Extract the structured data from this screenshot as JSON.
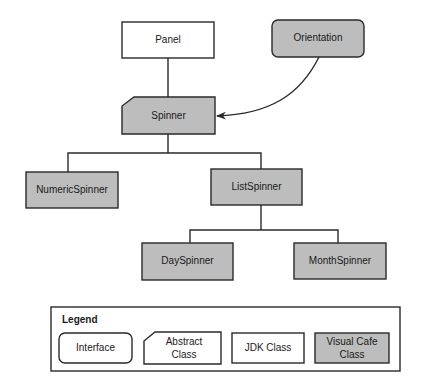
{
  "diagram": {
    "colors": {
      "visual_cafe_fill": "#bdbdbd",
      "jdk_fill": "#ffffff",
      "stroke": "#2a2a2a",
      "text": "#1a1a1a"
    },
    "nodes": [
      {
        "id": "panel",
        "label": "Panel",
        "kind": "jdk-class",
        "x": 122,
        "y": 22,
        "w": 92,
        "h": 36
      },
      {
        "id": "orientation",
        "label": "Orientation",
        "kind": "visual-cafe-interface",
        "x": 272,
        "y": 20,
        "w": 92,
        "h": 37
      },
      {
        "id": "spinner",
        "label": "Spinner",
        "kind": "visual-cafe-abstract-class",
        "x": 122,
        "y": 97,
        "w": 93,
        "h": 37
      },
      {
        "id": "numericspinner",
        "label": "NumericSpinner",
        "kind": "visual-cafe-class",
        "x": 26,
        "y": 172,
        "w": 92,
        "h": 36
      },
      {
        "id": "listspinner",
        "label": "ListSpinner",
        "kind": "visual-cafe-class",
        "x": 211,
        "y": 169,
        "w": 91,
        "h": 36
      },
      {
        "id": "dayspinner",
        "label": "DaySpinner",
        "kind": "visual-cafe-class",
        "x": 142,
        "y": 243,
        "w": 91,
        "h": 37
      },
      {
        "id": "monthspinner",
        "label": "MonthSpinner",
        "kind": "visual-cafe-class",
        "x": 294,
        "y": 243,
        "w": 92,
        "h": 36
      }
    ],
    "edges": [
      {
        "from": "panel",
        "to": "spinner",
        "type": "inheritance"
      },
      {
        "from": "orientation",
        "to": "spinner",
        "type": "implements-arrow"
      },
      {
        "from": "spinner",
        "to": "numericspinner",
        "type": "inheritance"
      },
      {
        "from": "spinner",
        "to": "listspinner",
        "type": "inheritance"
      },
      {
        "from": "listspinner",
        "to": "dayspinner",
        "type": "inheritance"
      },
      {
        "from": "listspinner",
        "to": "monthspinner",
        "type": "inheritance"
      }
    ]
  },
  "legend": {
    "title": "Legend",
    "items": [
      {
        "label_line1": "Interface",
        "label_line2": "",
        "kind": "interface"
      },
      {
        "label_line1": "Abstract",
        "label_line2": "Class",
        "kind": "abstract-class"
      },
      {
        "label_line1": "JDK Class",
        "label_line2": "",
        "kind": "jdk-class"
      },
      {
        "label_line1": "Visual Cafe",
        "label_line2": "Class",
        "kind": "visual-cafe-class"
      }
    ]
  }
}
